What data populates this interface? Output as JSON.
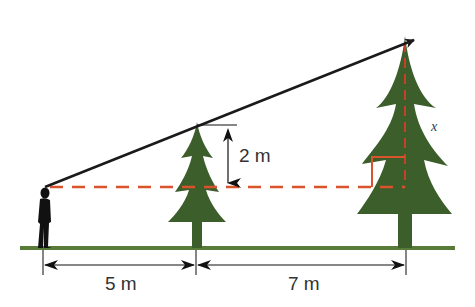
{
  "diagram": {
    "type": "similar-triangles tree height problem",
    "colors": {
      "tree": "#3b5e2b",
      "ground": "#5a7a3a",
      "sightline": "#1a1a1a",
      "guide": "#d9532c",
      "dimension": "#222222",
      "person": "#111111"
    },
    "labels": {
      "small_tree_height_above_eye": "2 m",
      "distance_person_to_small_tree": "5 m",
      "distance_small_tree_to_tall_tree": "7 m",
      "unknown": "x"
    },
    "elements": [
      "person-silhouette",
      "small-tree",
      "tall-tree",
      "sightline-arrow",
      "horizontal-eye-level-dashed-line",
      "vertical-dashed-line-tall-tree",
      "right-angle-marker",
      "ground-line"
    ]
  }
}
